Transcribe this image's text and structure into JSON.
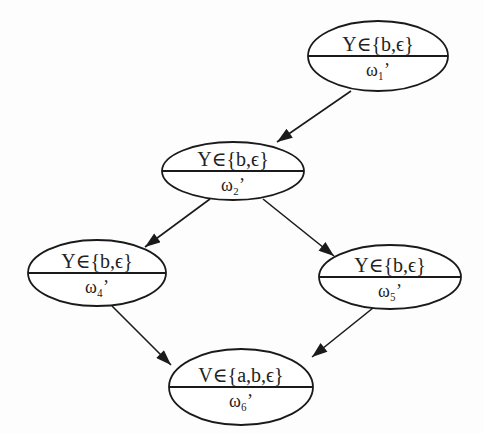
{
  "diagram": {
    "type": "directed-graph",
    "colors": {
      "stroke": "#1a1a1a",
      "fill": "#ffffff",
      "text": "#222222"
    },
    "nodes": [
      {
        "id": "n1",
        "top": "Y∈{b,ϵ}",
        "bottom": "ω₁’",
        "cx": 378,
        "cy": 56,
        "rx": 70,
        "ry": 35
      },
      {
        "id": "n2",
        "top": "Y∈{b,ϵ}",
        "bottom": "ω₂’",
        "cx": 233,
        "cy": 171,
        "rx": 71,
        "ry": 29
      },
      {
        "id": "n4",
        "top": "Y∈{b,ϵ}",
        "bottom": "ω₄’",
        "cx": 97,
        "cy": 273,
        "rx": 69,
        "ry": 33
      },
      {
        "id": "n5",
        "top": "Y∈{b,ϵ}",
        "bottom": "ω₅’",
        "cx": 390,
        "cy": 277,
        "rx": 71,
        "ry": 32
      },
      {
        "id": "n6",
        "top": "V∈{a,b,ϵ}",
        "bottom": "ω₆’",
        "cx": 241,
        "cy": 387,
        "rx": 72,
        "ry": 38
      }
    ],
    "edges": [
      {
        "from": "n1",
        "to": "n2",
        "x1": 351,
        "y1": 91,
        "x2": 277,
        "y2": 142
      },
      {
        "from": "n2",
        "to": "n4",
        "x1": 210,
        "y1": 199,
        "x2": 145,
        "y2": 247
      },
      {
        "from": "n2",
        "to": "n5",
        "x1": 263,
        "y1": 199,
        "x2": 334,
        "y2": 256
      },
      {
        "from": "n4",
        "to": "n6",
        "x1": 112,
        "y1": 306,
        "x2": 171,
        "y2": 365
      },
      {
        "from": "n5",
        "to": "n6",
        "x1": 373,
        "y1": 308,
        "x2": 312,
        "y2": 357
      }
    ]
  }
}
